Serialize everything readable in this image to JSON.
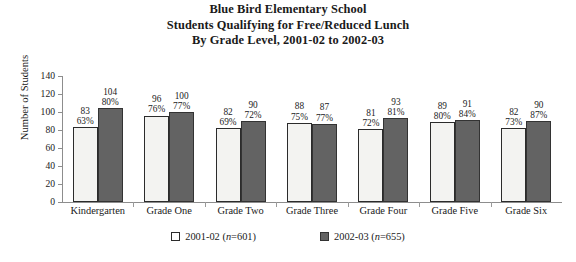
{
  "title": {
    "line1": "Blue Bird Elementary School",
    "line2": "Students Qualifying for Free/Reduced Lunch",
    "line3": "By Grade Level, 2001-02 to 2002-03"
  },
  "legend": {
    "items": [
      {
        "label": "2001-02 (n=601)",
        "swatch": "white-square-swatch"
      },
      {
        "label": "2002-03 (n=655)",
        "swatch": "gray-square-swatch"
      }
    ]
  },
  "colors": {
    "series_2001_02": "#f3f3f1",
    "series_2002_03": "#636363",
    "outline": "#2b2b2b",
    "axis": "#8d8d8d",
    "text": "#1a1a1a"
  },
  "chart_data": {
    "type": "bar",
    "title": "Blue Bird Elementary School Students Qualifying for Free/Reduced Lunch By Grade Level, 2001-02 to 2002-03",
    "xlabel": "",
    "ylabel": "Number of Students",
    "ylim": [
      0,
      140
    ],
    "yticks": [
      0,
      20,
      40,
      60,
      80,
      100,
      120,
      140
    ],
    "grid": false,
    "legend_position": "bottom",
    "categories": [
      "Kindergarten",
      "Grade One",
      "Grade Two",
      "Grade Three",
      "Grade Four",
      "Grade Five",
      "Grade Six"
    ],
    "series": [
      {
        "name": "2001-02 (n=601)",
        "values": [
          83,
          96,
          82,
          88,
          81,
          89,
          82
        ],
        "percent_labels": [
          "63%",
          "76%",
          "69%",
          "75%",
          "72%",
          "80%",
          "73%"
        ]
      },
      {
        "name": "2002-03 (n=655)",
        "values": [
          104,
          100,
          90,
          87,
          93,
          91,
          90
        ],
        "percent_labels": [
          "80%",
          "77%",
          "72%",
          "77%",
          "81%",
          "84%",
          "87%"
        ]
      }
    ]
  }
}
